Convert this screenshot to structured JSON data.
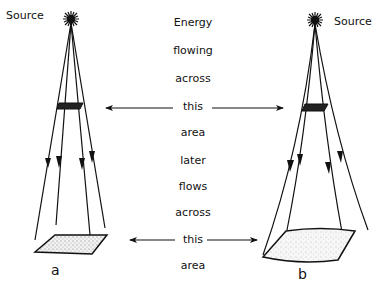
{
  "labels": {
    "source_left": "Source",
    "source_right": "Source",
    "sub_a": "a",
    "sub_b": "b"
  },
  "center_text": [
    "Energy",
    "flowing",
    "across",
    "this",
    "area",
    "later",
    "flows",
    "across",
    "this",
    "area"
  ],
  "colors": {
    "ink": "#111111",
    "background": "#ffffff",
    "stipple": "#8a8a8a"
  }
}
